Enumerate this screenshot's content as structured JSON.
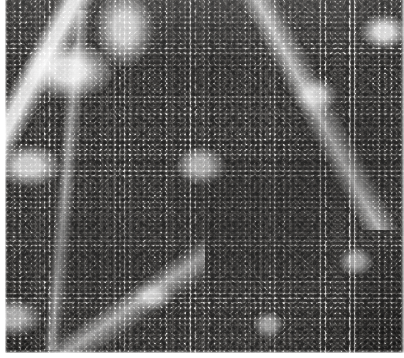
{
  "figure": {
    "kind": "histology-micrograph",
    "modality": "light microscopy",
    "staining": "hematoxylin and eosin (H&E)",
    "rendering": "grayscale halftone print scan",
    "caption_text": "",
    "palette": {
      "page_background": "#ffffff",
      "plate_light": "#efeeec",
      "plate_midtone": "#8d8b88",
      "nuclei_dark": "#24221f",
      "nuclei_mid": "#3b3937",
      "sinusoid_pale": "#fbfbfa"
    },
    "plate": {
      "left_px": 5,
      "top_px": 0,
      "width_px": 399,
      "height_px": 353
    },
    "margins": {
      "left_px": 5,
      "top_px": 0,
      "right_px": 0,
      "bottom_px": 5
    }
  }
}
